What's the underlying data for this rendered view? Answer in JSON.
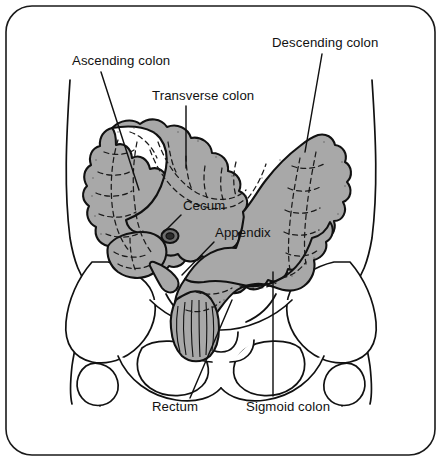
{
  "figure": {
    "background_color": "#ffffff",
    "border_color": "#1a1a1a",
    "line_color": "#111111",
    "colon_fill_color": "#a8a8a8",
    "label_text_color": "#111111"
  },
  "labels": [
    {
      "id": "ascending-colon",
      "text": "Ascending colon",
      "x": 72,
      "y": 54,
      "leader": {
        "x1": 101,
        "y1": 72,
        "x2": 139,
        "y2": 190
      }
    },
    {
      "id": "transverse-colon",
      "text": "Transverse colon",
      "x": 152,
      "y": 89,
      "leader": {
        "x1": 186,
        "y1": 106,
        "x2": 186,
        "y2": 168
      }
    },
    {
      "id": "descending-colon",
      "text": "Descending colon",
      "x": 272,
      "y": 36,
      "leader": {
        "x1": 322,
        "y1": 54,
        "x2": 305,
        "y2": 152
      }
    },
    {
      "id": "cecum",
      "text": "Cecum",
      "x": 183,
      "y": 199,
      "leader": {
        "x1": 181,
        "y1": 215,
        "x2": 163,
        "y2": 233
      }
    },
    {
      "id": "appendix",
      "text": "Appendix",
      "x": 215,
      "y": 226,
      "leader": {
        "x1": 214,
        "y1": 242,
        "x2": 182,
        "y2": 275
      }
    },
    {
      "id": "rectum",
      "text": "Rectum",
      "x": 152,
      "y": 400,
      "leader": {
        "x1": 190,
        "y1": 398,
        "x2": 232,
        "y2": 300
      }
    },
    {
      "id": "sigmoid-colon",
      "text": "Sigmoid colon",
      "x": 246,
      "y": 400,
      "leader": {
        "x1": 273,
        "y1": 396,
        "x2": 273,
        "y2": 272
      }
    }
  ],
  "anatomy_parts": [
    {
      "id": "cecum-part",
      "name": "Cecum"
    },
    {
      "id": "appendix-part",
      "name": "Appendix"
    },
    {
      "id": "ascending-colon-part",
      "name": "Ascending colon"
    },
    {
      "id": "transverse-colon-part",
      "name": "Transverse colon"
    },
    {
      "id": "descending-colon-part",
      "name": "Descending colon"
    },
    {
      "id": "sigmoid-colon-part",
      "name": "Sigmoid colon"
    },
    {
      "id": "rectum-part",
      "name": "Rectum"
    },
    {
      "id": "pelvis-part",
      "name": "Pelvic bones"
    },
    {
      "id": "torso-outline-part",
      "name": "Torso outline"
    }
  ]
}
